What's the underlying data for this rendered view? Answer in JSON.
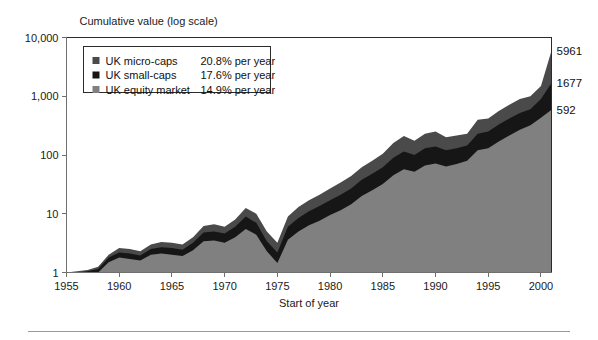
{
  "figure": {
    "y_axis_title": "Cumulative value (log scale)",
    "x_axis_title": "Start of year",
    "footer_rule": "divider"
  },
  "legend": {
    "position": "top-left-inside",
    "items": [
      {
        "label": "UK micro-caps",
        "rate": "20.8% per year",
        "color": "#4a4a4a",
        "swatch": "legend-swatch-micro-caps"
      },
      {
        "label": "UK small-caps",
        "rate": "17.6% per year",
        "color": "#161616",
        "swatch": "legend-swatch-small-caps"
      },
      {
        "label": "UK equity market",
        "rate": "14.9% per year",
        "color": "#808080",
        "swatch": "legend-swatch-equity-market"
      }
    ]
  },
  "end_labels": [
    {
      "text": "5961",
      "series": "UK micro-caps"
    },
    {
      "text": "1677",
      "series": "UK small-caps"
    },
    {
      "text": "592",
      "series": "UK equity market"
    }
  ],
  "chart_data": {
    "type": "area",
    "stacking": "overlaid-bands",
    "title": "Cumulative value (log scale)",
    "xlabel": "Start of year",
    "ylabel": "Cumulative value (log scale)",
    "yscale": "log",
    "ylim": [
      1,
      10000
    ],
    "ytick_labels": [
      "1",
      "10",
      "100",
      "1,000",
      "10,000"
    ],
    "ytick_values": [
      1,
      10,
      100,
      1000,
      10000
    ],
    "xlim": [
      1955,
      2001
    ],
    "xtick_labels": [
      "1955",
      "1960",
      "1965",
      "1970",
      "1975",
      "1980",
      "1985",
      "1990",
      "1995",
      "2000"
    ],
    "xtick_values": [
      1955,
      1960,
      1965,
      1970,
      1975,
      1980,
      1985,
      1990,
      1995,
      2000
    ],
    "grid": false,
    "x": [
      1955,
      1956,
      1957,
      1958,
      1959,
      1960,
      1961,
      1962,
      1963,
      1964,
      1965,
      1966,
      1967,
      1968,
      1969,
      1970,
      1971,
      1972,
      1973,
      1974,
      1975,
      1976,
      1977,
      1978,
      1979,
      1980,
      1981,
      1982,
      1983,
      1984,
      1985,
      1986,
      1987,
      1988,
      1989,
      1990,
      1991,
      1992,
      1993,
      1994,
      1995,
      1996,
      1997,
      1998,
      1999,
      2000,
      2001
    ],
    "series": [
      {
        "name": "UK micro-caps",
        "color": "#4a4a4a",
        "annual_return": "20.8% per year",
        "end_value": 5961,
        "values": [
          1,
          1.05,
          1.1,
          1.25,
          2.0,
          2.6,
          2.5,
          2.3,
          3.0,
          3.3,
          3.2,
          3.0,
          4.0,
          6.2,
          6.6,
          6.0,
          8.0,
          12.5,
          10.0,
          5.0,
          3.2,
          9.0,
          13.0,
          17.0,
          21.0,
          27.0,
          34.0,
          44.0,
          62.0,
          80.0,
          105.0,
          160.0,
          210.0,
          175.0,
          230.0,
          250.0,
          200.0,
          215.0,
          230.0,
          400.0,
          420.0,
          560.0,
          720.0,
          900.0,
          1000.0,
          1500.0,
          5961.0
        ]
      },
      {
        "name": "UK small-caps",
        "color": "#161616",
        "annual_return": "17.6% per year",
        "end_value": 1677,
        "values": [
          1,
          1.0,
          1.05,
          1.15,
          1.8,
          2.2,
          2.1,
          1.95,
          2.5,
          2.7,
          2.6,
          2.45,
          3.2,
          4.8,
          5.0,
          4.6,
          6.0,
          9.0,
          7.0,
          3.4,
          2.2,
          6.0,
          8.5,
          11.0,
          13.5,
          17.0,
          21.0,
          27.0,
          38.0,
          48.0,
          62.0,
          90.0,
          115.0,
          100.0,
          130.0,
          140.0,
          120.0,
          130.0,
          145.0,
          230.0,
          250.0,
          330.0,
          420.0,
          520.0,
          600.0,
          900.0,
          1677.0
        ]
      },
      {
        "name": "UK equity market",
        "color": "#808080",
        "annual_return": "14.9% per year",
        "end_value": 592,
        "values": [
          1,
          0.95,
          0.95,
          1.0,
          1.5,
          1.8,
          1.7,
          1.6,
          2.0,
          2.1,
          2.0,
          1.9,
          2.4,
          3.4,
          3.5,
          3.2,
          4.0,
          5.5,
          4.4,
          2.3,
          1.45,
          3.6,
          5.0,
          6.4,
          7.6,
          9.5,
          11.5,
          14.5,
          20.0,
          25.0,
          32.0,
          45.0,
          57.0,
          52.0,
          66.0,
          72.0,
          64.0,
          70.0,
          80.0,
          120.0,
          130.0,
          170.0,
          215.0,
          270.0,
          320.0,
          430.0,
          592.0
        ]
      }
    ]
  }
}
